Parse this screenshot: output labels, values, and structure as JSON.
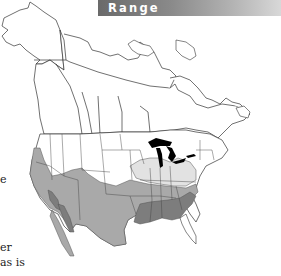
{
  "header": {
    "title": "Range"
  },
  "text_fragments": {
    "line1": "e",
    "line2": "er",
    "line3": "as is"
  },
  "map": {
    "subject": "North America range map",
    "colors": {
      "background": "#ffffff",
      "outline": "#333333",
      "land": "#ffffff",
      "range_light": "#e2e2e2",
      "range_medium": "#a9a9a9",
      "range_dark": "#7d7d7d",
      "lakes": "#000000",
      "header_dark": "#6a6a6a",
      "header_light": "#d8d8d8"
    }
  }
}
